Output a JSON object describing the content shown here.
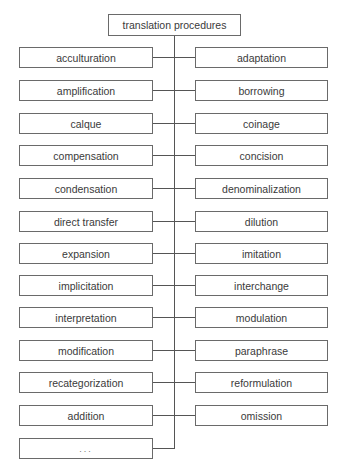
{
  "diagram": {
    "root": "translation procedures",
    "left": [
      "acculturation",
      "amplification",
      "calque",
      "compensation",
      "condensation",
      "direct transfer",
      "expansion",
      "implicitation",
      "interpretation",
      "modification",
      "recategorization",
      "addition",
      "..."
    ],
    "right": [
      "adaptation",
      "borrowing",
      "coinage",
      "concision",
      "denominalization",
      "dilution",
      "imitation",
      "interchange",
      "modulation",
      "paraphrase",
      "reformulation",
      "omission"
    ]
  },
  "colors": {
    "border": "#6a6a6a",
    "line": "#555555",
    "text": "#3a3a3a",
    "background": "#ffffff"
  }
}
